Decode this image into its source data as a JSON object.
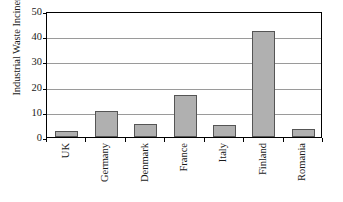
{
  "chart_data": {
    "type": "bar",
    "title": "",
    "xlabel": "",
    "ylabel": "Industrial Waste Incinerated (%)",
    "categories": [
      "UK",
      "Germany",
      "Denmark",
      "France",
      "Italy",
      "Finland",
      "Romania"
    ],
    "values": [
      2.3,
      10.5,
      5.3,
      16.5,
      4.6,
      42,
      3.3
    ],
    "ylim": [
      0,
      50
    ],
    "yticks": [
      0,
      10,
      20,
      30,
      40,
      50
    ],
    "ytick_labels": [
      "0",
      "10",
      "20",
      "30",
      "40",
      "50"
    ],
    "grid": true,
    "legend": "none",
    "bar_color": "#b0b0b0",
    "bar_edge_color": "#555555",
    "axis_color": "#000000",
    "gridline_color": "#9a9a9a",
    "plot_background": "#ffffff"
  }
}
